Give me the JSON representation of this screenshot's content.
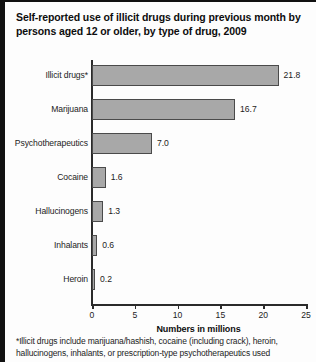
{
  "figure": {
    "title": "Self-reported use of illicit drugs during previous month by persons aged 12 or older, by type of drug, 2009",
    "footnote": "*Illicit drugs include marijuana/hashish, cocaine (including crack), heroin, hallucinogens, inhalants, or prescription-type psychotherapeutics used"
  },
  "chart_data": {
    "type": "bar",
    "orientation": "horizontal",
    "title": "Self-reported use of illicit drugs during previous month by persons aged 12 or older, by type of drug, 2009",
    "categories": [
      "Illicit drugs*",
      "Marijuana",
      "Psychotherapeutics",
      "Cocaine",
      "Hallucinogens",
      "Inhalants",
      "Heroin"
    ],
    "values": [
      21.8,
      16.7,
      7.0,
      1.6,
      1.3,
      0.6,
      0.2
    ],
    "value_labels": [
      "21.8",
      "16.7",
      "7.0",
      "1.6",
      "1.3",
      "0.6",
      "0.2"
    ],
    "xlabel": "Numbers in millions",
    "ylabel": "",
    "xlim": [
      0,
      25
    ],
    "xticks": [
      0,
      5,
      10,
      15,
      20,
      25
    ],
    "xtick_labels": [
      "0",
      "5",
      "10",
      "15",
      "20",
      "25"
    ],
    "grid": false,
    "legend": false,
    "bar_fill": "#a8a8a8",
    "bar_edge": "#4a4a4a"
  }
}
